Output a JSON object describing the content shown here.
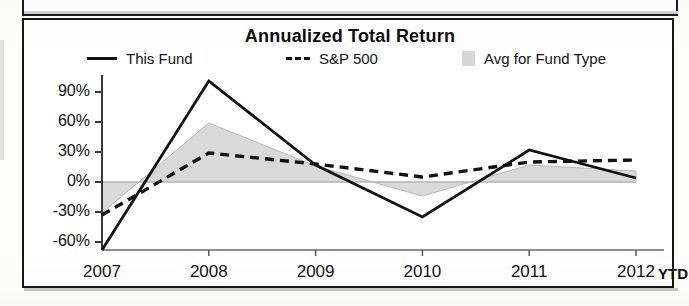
{
  "chart": {
    "title": "Annualized Total Return",
    "legend": [
      {
        "label": "This Fund",
        "marker": "solid-line-swatch",
        "color": "#111111"
      },
      {
        "label": "S&P 500",
        "marker": "dashed-line-swatch",
        "color": "#111111"
      },
      {
        "label": "Avg for Fund Type",
        "marker": "area-swatch",
        "color": "#cfcfcf"
      }
    ],
    "x_suffix_label": "YTD"
  },
  "chart_data": {
    "type": "line",
    "title": "Annualized Total Return",
    "xlabel": "",
    "ylabel": "",
    "categories": [
      "2007",
      "2008",
      "2009",
      "2010",
      "2011",
      "2012"
    ],
    "x_axis_note": "YTD",
    "ytick_labels": [
      "90%",
      "60%",
      "30%",
      "0%",
      "-30%",
      "-60%"
    ],
    "ytick_values": [
      90,
      60,
      30,
      0,
      -30,
      -60
    ],
    "ylim": [
      -68,
      105
    ],
    "grid": false,
    "legend_position": "top",
    "series": [
      {
        "name": "This Fund",
        "style": "solid",
        "color": "#111111",
        "values": [
          -68,
          101,
          17,
          -35,
          32,
          4
        ]
      },
      {
        "name": "S&P 500",
        "style": "dashed",
        "color": "#111111",
        "values": [
          -33,
          29,
          18,
          5,
          20,
          22
        ]
      },
      {
        "name": "Avg for Fund Type",
        "style": "area",
        "color": "#cfcfcf",
        "baseline": 0,
        "values": [
          -31,
          59,
          16,
          -14,
          17,
          11
        ]
      }
    ]
  }
}
